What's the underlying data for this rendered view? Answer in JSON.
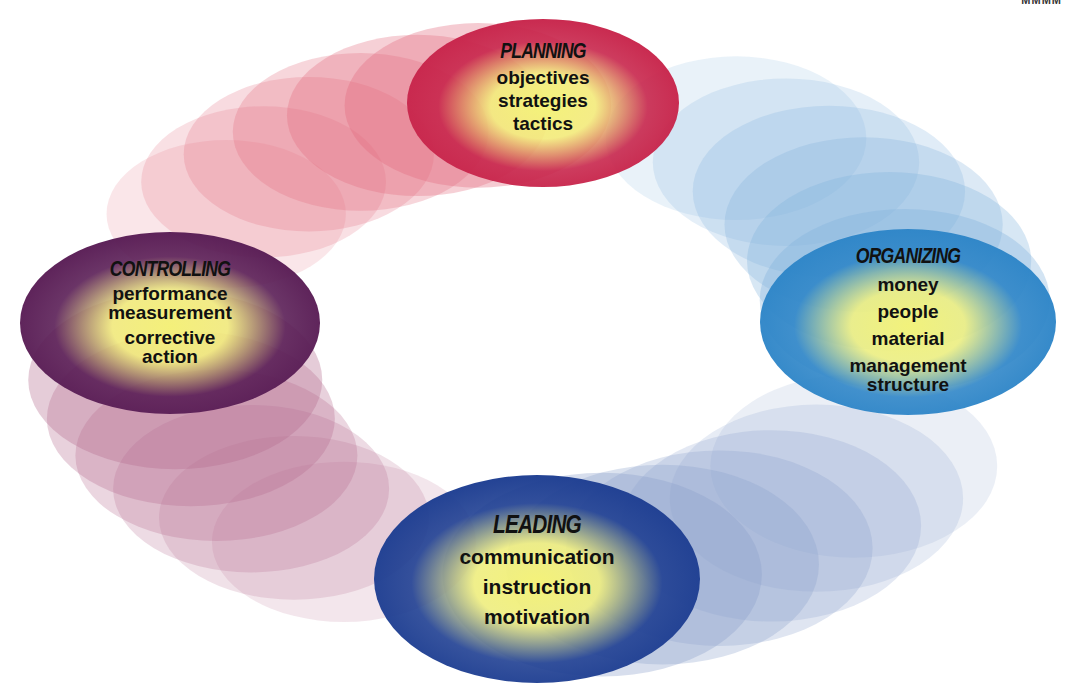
{
  "diagram": {
    "type": "management-functions-cycle",
    "corner_text": "MMMM",
    "functions": [
      {
        "id": "planning",
        "title": "PLANNING",
        "items": [
          "objectives",
          "strategies",
          "tactics"
        ],
        "edge_color": "#c8264c",
        "trail_color": "#e2687c",
        "center_color": "#f4f27a"
      },
      {
        "id": "organizing",
        "title": "ORGANIZING",
        "items": [
          "money",
          "people",
          "material",
          "management structure"
        ],
        "edge_color": "#2f86c8",
        "trail_color": "#7fb0dc",
        "center_color": "#f2f27c"
      },
      {
        "id": "leading",
        "title": "LEADING",
        "items": [
          "communication",
          "instruction",
          "motivation"
        ],
        "edge_color": "#1f3f92",
        "trail_color": "#8aa0cc",
        "center_color": "#f4f27a"
      },
      {
        "id": "controlling",
        "title": "CONTROLLING",
        "items": [
          "performance measurement",
          "corrective action"
        ],
        "edge_color": "#5a1e56",
        "trail_color": "#b56a8e",
        "center_color": "#f4f07a"
      }
    ]
  }
}
